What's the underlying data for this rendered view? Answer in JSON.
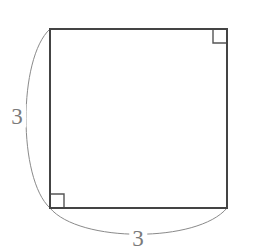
{
  "figure": {
    "kind": "geometry-diagram",
    "canvas": {
      "width": 253,
      "height": 252,
      "background": "#ffffff"
    },
    "shape": {
      "name": "square",
      "stroke_color": "#444444",
      "stroke_width": 2,
      "fill": "none",
      "left": 50,
      "top": 29,
      "right": 227,
      "bottom": 208,
      "side_length_px": 178
    },
    "right_angle_markers": [
      {
        "name": "top-right-right-angle",
        "corner": "top-right",
        "size_px": 13,
        "stroke_color": "#555555",
        "stroke_width": 1.4
      },
      {
        "name": "bottom-left-right-angle",
        "corner": "bottom-left",
        "size_px": 13,
        "stroke_color": "#555555",
        "stroke_width": 1.4
      }
    ],
    "arcs": [
      {
        "name": "left-side-dimension-arc",
        "measures": "left side",
        "from": "top-left-corner",
        "to": "bottom-left-corner",
        "bulge_direction": "left",
        "extreme_px": 18,
        "stroke_color": "#8a8a8a",
        "stroke_width": 1
      },
      {
        "name": "bottom-side-dimension-arc",
        "measures": "bottom side",
        "from": "bottom-left-corner",
        "to": "bottom-right-corner",
        "bulge_direction": "down",
        "extreme_px": 243,
        "stroke_color": "#8a8a8a",
        "stroke_width": 1
      }
    ],
    "labels": [
      {
        "name": "left-side-length-label",
        "text": "3",
        "x": 17,
        "y": 116,
        "color": "#7a7a7a",
        "font_size": 23
      },
      {
        "name": "bottom-side-length-label",
        "text": "3",
        "x": 138,
        "y": 238,
        "color": "#7a7a7a",
        "font_size": 23
      }
    ]
  }
}
